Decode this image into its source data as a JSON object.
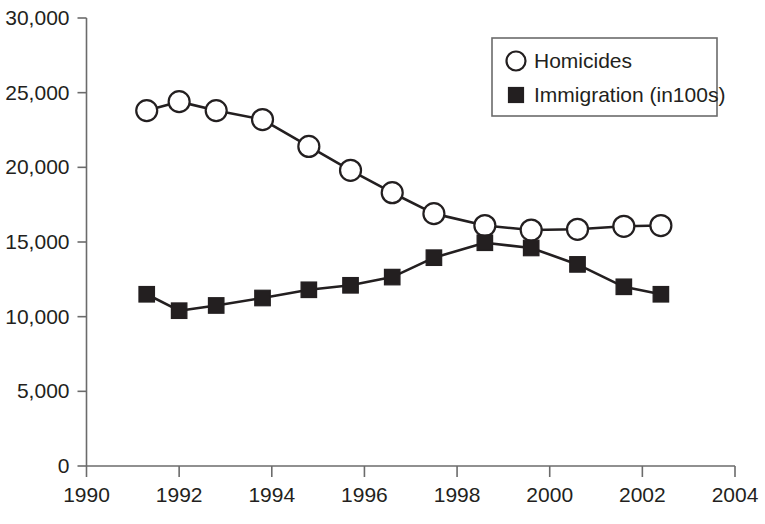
{
  "chart_data": {
    "type": "line",
    "title": "",
    "subtitle": "",
    "xlabel": "",
    "ylabel": "",
    "xlim": [
      1990,
      2004
    ],
    "ylim": [
      0,
      30000
    ],
    "grid": false,
    "legend_position": "top-right",
    "x_ticks": [
      "1990",
      "1992",
      "1994",
      "1996",
      "1998",
      "2000",
      "2002",
      "2004"
    ],
    "x_tick_values": [
      1990,
      1992,
      1994,
      1996,
      1998,
      2000,
      2002,
      2004
    ],
    "y_ticks": [
      "0",
      "5,000",
      "10,000",
      "15,000",
      "20,000",
      "25,000",
      "30,000"
    ],
    "y_tick_values": [
      0,
      5000,
      10000,
      15000,
      20000,
      25000,
      30000
    ],
    "series": [
      {
        "name": "Homicides",
        "marker": "open-circle",
        "x": [
          1991.3,
          1992.0,
          1992.8,
          1993.8,
          1994.8,
          1995.7,
          1996.6,
          1997.5,
          1998.6,
          1999.6,
          2000.6,
          2001.6,
          2002.4
        ],
        "values": [
          23800,
          24400,
          23800,
          23200,
          21400,
          19800,
          18300,
          16900,
          16100,
          15800,
          15850,
          16050,
          16100
        ]
      },
      {
        "name": "Immigration (in100s)",
        "marker": "filled-square",
        "x": [
          1991.3,
          1992.0,
          1992.8,
          1993.8,
          1994.8,
          1995.7,
          1996.6,
          1997.5,
          1998.6,
          1999.6,
          2000.6,
          2001.6,
          2002.4
        ],
        "values": [
          11500,
          10400,
          10750,
          11250,
          11800,
          12100,
          12650,
          13950,
          14950,
          14600,
          13500,
          12000,
          11500
        ]
      }
    ],
    "legend": [
      {
        "label": "Homicides",
        "marker": "open-circle"
      },
      {
        "label": "Immigration (in100s)",
        "marker": "filled-square"
      }
    ],
    "colors": {
      "line": "#231f20",
      "axis": "#6b6b6b",
      "text": "#231f20",
      "background": "#ffffff"
    }
  }
}
